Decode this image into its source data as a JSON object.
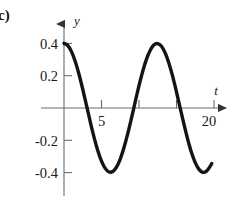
{
  "figure": {
    "part_label": "c)",
    "background_color": "#ffffff",
    "curve_color": "#141414",
    "axis_color": "#6b6b6b"
  },
  "chart_data": {
    "type": "line",
    "title": "",
    "xlabel": "t",
    "ylabel": "y",
    "xlim": [
      -1.5,
      23
    ],
    "ylim": [
      -0.52,
      0.56
    ],
    "grid": false,
    "legend": null,
    "x_ticks": [
      5,
      20
    ],
    "x_tick_labels": [
      "5",
      "20"
    ],
    "x_minor_ticks": [
      5,
      10,
      15,
      20
    ],
    "y_ticks": [
      0.4,
      0.2,
      -0.2,
      -0.4
    ],
    "y_tick_labels": [
      "0.4",
      "0.2",
      "-0.2",
      "-0.4"
    ],
    "amplitude": 0.4,
    "period": 9.7,
    "x": [
      0,
      0.5,
      1,
      1.5,
      2,
      2.5,
      3,
      3.5,
      4,
      4.5,
      5,
      5.5,
      6,
      6.5,
      7,
      7.5,
      8,
      8.5,
      9,
      9.5,
      10,
      10.5,
      11,
      11.5,
      12,
      12.5,
      13,
      13.5,
      14,
      14.5,
      15,
      15.5,
      16,
      16.5,
      17,
      17.5,
      18,
      18.5,
      19,
      19.5,
      19.7
    ],
    "y": [
      0.4,
      0.387,
      0.349,
      0.288,
      0.209,
      0.116,
      0.016,
      -0.085,
      -0.18,
      -0.263,
      -0.329,
      -0.374,
      -0.396,
      -0.393,
      -0.366,
      -0.316,
      -0.245,
      -0.159,
      -0.062,
      0.039,
      0.138,
      0.228,
      0.303,
      0.358,
      0.391,
      0.399,
      0.382,
      0.34,
      0.276,
      0.194,
      0.099,
      -0.002,
      -0.102,
      -0.195,
      -0.276,
      -0.338,
      -0.38,
      -0.398,
      -0.391,
      -0.36,
      -0.344
    ]
  }
}
